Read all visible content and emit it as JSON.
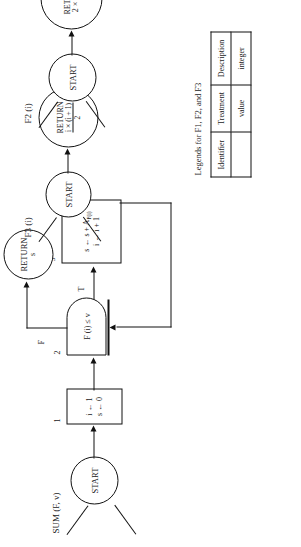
{
  "figures": {
    "sum": {
      "title": "SUM (F, v)",
      "start_label": "START",
      "box1": {
        "number": "1",
        "line1": "i ← 1",
        "line2": "s ← 0"
      },
      "decision": {
        "number": "2",
        "text": "F (i) ≤ v",
        "true_label": "T",
        "false_label": "F"
      },
      "box3": {
        "number": "3",
        "line1_pre": "s ← s + A",
        "line1_sub": "F(i)",
        "line2": "i ← i + 1"
      },
      "return": {
        "word": "RETURN",
        "value": "s"
      }
    },
    "f2": {
      "title": "F2 (i)",
      "start_label": "START",
      "return": {
        "word": "RETURN",
        "value": "2 × i − 1"
      }
    },
    "f3": {
      "title": "F3 (i)",
      "start_label": "START",
      "return": {
        "word": "RETURN",
        "numerator": "i × (i + 1)",
        "denominator": "2"
      }
    }
  },
  "legend": {
    "title": "Legends for F1, F2, and F3",
    "headers": [
      "Identifier",
      "Treatment",
      "Description"
    ],
    "rows": [
      [
        "",
        "value",
        "integer"
      ]
    ]
  },
  "colors": {
    "ink": "#111111",
    "paper": "#ffffff"
  }
}
